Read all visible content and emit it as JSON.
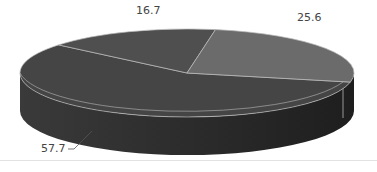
{
  "chart_data": {
    "type": "pie",
    "variant": "3d",
    "title": "",
    "categories": [
      "Slice A",
      "Slice B",
      "Slice C"
    ],
    "values": [
      57.7,
      16.7,
      25.6
    ],
    "labels": [
      "57.7",
      "16.7",
      "25.6"
    ],
    "legend": "none",
    "colors": [
      "#454545",
      "#4f4f4f",
      "#6b6b6b"
    ]
  },
  "colors": {
    "side": "#2e2e2e",
    "side_dark": "#1f1f1f",
    "edge": "#bdbdbd",
    "label": "#444444"
  }
}
